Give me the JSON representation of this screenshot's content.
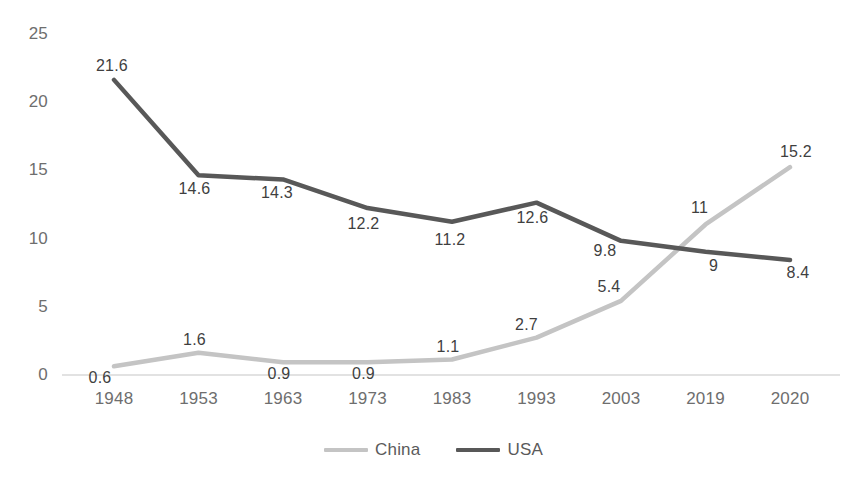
{
  "chart_data": {
    "type": "line",
    "title": "",
    "subtitle": "",
    "xlabel": "",
    "ylabel": "",
    "categories": [
      "1948",
      "1953",
      "1963",
      "1973",
      "1983",
      "1993",
      "2003",
      "2019",
      "2020"
    ],
    "series": [
      {
        "name": "China",
        "color": "#c4c4c4",
        "values": [
          0.6,
          1.6,
          0.9,
          0.9,
          1.1,
          2.7,
          5.4,
          11,
          15.2
        ],
        "labels": [
          "0.6",
          "1.6",
          "0.9",
          "0.9",
          "1.1",
          "2.7",
          "5.4",
          "11",
          "15.2"
        ]
      },
      {
        "name": "USA",
        "color": "#585858",
        "values": [
          21.6,
          14.6,
          14.3,
          12.2,
          11.2,
          12.6,
          9.8,
          9,
          8.4
        ],
        "labels": [
          "21.6",
          "14.6",
          "14.3",
          "12.2",
          "11.2",
          "12.6",
          "9.8",
          "9",
          "8.4"
        ]
      }
    ],
    "yticks": [
      0,
      5,
      10,
      15,
      20,
      25
    ],
    "ytick_labels": [
      "0",
      "5",
      "10",
      "15",
      "20",
      "25"
    ],
    "ylim": [
      0,
      25
    ],
    "grid": false,
    "baseline_visible": true,
    "legend_position": "bottom-center",
    "legend_entries": [
      "China",
      "USA"
    ],
    "data_labels_shown": true
  },
  "colors": {
    "background": "#ffffff",
    "axis_text": "#6e6e6e",
    "data_label_text": "#3f3f3f",
    "baseline": "#d9d9d9",
    "china_line": "#c4c4c4",
    "usa_line": "#585858"
  }
}
